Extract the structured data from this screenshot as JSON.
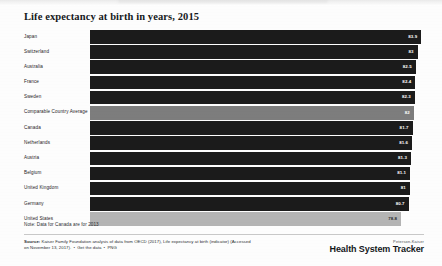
{
  "chart_title": "Life expectancy at birth in years, 2015",
  "note": "Note: Data for Canada are for 2013",
  "source": {
    "prefix": "Source:",
    "text": "Kaiser Family Foundation analysis of data from OECD (2017), Life expectancy at birth (indicator) (Accessed on November 13, 2017).",
    "link_get_data": "Get the data",
    "link_png": "PNG",
    "separator": "•"
  },
  "logo": {
    "superline": "Peterson-Kaiser",
    "title": "Health System Tracker"
  },
  "colors": {
    "bar_default": "#1b1b1b",
    "bar_average": "#7d7d7d",
    "bar_highlight": "#b4b4b4",
    "background": "#fdfdfd",
    "text": "#1d2124"
  },
  "chart_data": {
    "type": "bar",
    "orientation": "horizontal",
    "title": "Life expectancy at birth in years, 2015",
    "xlabel": "",
    "ylabel": "",
    "xlim": [
      0,
      84.6
    ],
    "grid": false,
    "legend": "none",
    "categories": [
      "Japan",
      "Switzerland",
      "Australia",
      "France",
      "Sweden",
      "Comparable Country Average",
      "Canada",
      "Netherlands",
      "Austria",
      "Belgium",
      "United Kingdom",
      "Germany",
      "United States"
    ],
    "values": [
      83.9,
      83,
      82.5,
      82.4,
      82.3,
      82,
      81.7,
      81.6,
      81.3,
      81.1,
      81,
      80.7,
      78.8
    ],
    "value_labels": [
      "83.9",
      "83",
      "82.5",
      "82.4",
      "82.3",
      "82",
      "81.7",
      "81.6",
      "81.3",
      "81.1",
      "81",
      "80.7",
      "78.8"
    ],
    "styles": [
      "default",
      "default",
      "default",
      "default",
      "default",
      "average",
      "default",
      "default",
      "default",
      "default",
      "default",
      "default",
      "highlight"
    ],
    "bars": [
      {
        "label": "Japan",
        "value": 83.9,
        "value_label": "83.9",
        "style": "default"
      },
      {
        "label": "Switzerland",
        "value": 83,
        "value_label": "83",
        "style": "default"
      },
      {
        "label": "Australia",
        "value": 82.5,
        "value_label": "82.5",
        "style": "default"
      },
      {
        "label": "France",
        "value": 82.4,
        "value_label": "82.4",
        "style": "default"
      },
      {
        "label": "Sweden",
        "value": 82.3,
        "value_label": "82.3",
        "style": "default"
      },
      {
        "label": "Comparable Country Average",
        "value": 82,
        "value_label": "82",
        "style": "average"
      },
      {
        "label": "Canada",
        "value": 81.7,
        "value_label": "81.7",
        "style": "default"
      },
      {
        "label": "Netherlands",
        "value": 81.6,
        "value_label": "81.6",
        "style": "default"
      },
      {
        "label": "Austria",
        "value": 81.3,
        "value_label": "81.3",
        "style": "default"
      },
      {
        "label": "Belgium",
        "value": 81.1,
        "value_label": "81.1",
        "style": "default"
      },
      {
        "label": "United Kingdom",
        "value": 81,
        "value_label": "81",
        "style": "default"
      },
      {
        "label": "Germany",
        "value": 80.7,
        "value_label": "80.7",
        "style": "default"
      },
      {
        "label": "United States",
        "value": 78.8,
        "value_label": "78.8",
        "style": "highlight"
      }
    ]
  }
}
